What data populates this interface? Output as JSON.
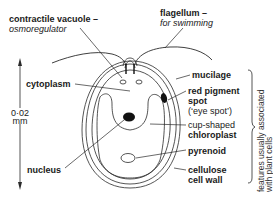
{
  "diagram": {
    "labels": {
      "contractile_vacuole": "contractile vacuole –",
      "contractile_vacuole_note": "osmoregulator",
      "flagellum": "flagellum –",
      "flagellum_note": "for swimming",
      "cytoplasm": "cytoplasm",
      "nucleus": "nucleus",
      "mucilage": "mucilage",
      "red_pigment_1": "red pigment",
      "red_pigment_2": "spot",
      "eye_spot": "(‘eye spot’)",
      "chloroplast_1": "cup-shaped",
      "chloroplast_2": "chloroplast",
      "pyrenoid": "pyrenoid",
      "cell_wall_1": "cellulose",
      "cell_wall_2": "cell wall"
    },
    "scale": {
      "value": "0·02",
      "unit": "mm"
    },
    "bracket_note": {
      "line1": "features usually associated",
      "line2": "with plant cells"
    },
    "colors": {
      "line": "#2a2a2a",
      "text": "#1a1a1a",
      "organelle_fill": "#111111"
    }
  }
}
